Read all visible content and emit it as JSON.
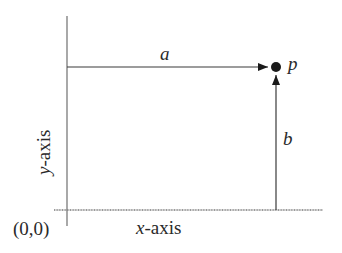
{
  "diagram": {
    "type": "coordinate-vector-diagram",
    "origin_label": "(0,0)",
    "x_axis_label_var": "x",
    "x_axis_label_rest": "-axis",
    "y_axis_label_var": "y",
    "y_axis_label_rest": "-axis",
    "point_label": "p",
    "horizontal_arrow_label": "a",
    "vertical_arrow_label": "b",
    "colors": {
      "axis": "#7a7a7a",
      "arrow": "#3a3a3a",
      "point": "#1a1a1a",
      "text": "#2a2a2a"
    }
  }
}
